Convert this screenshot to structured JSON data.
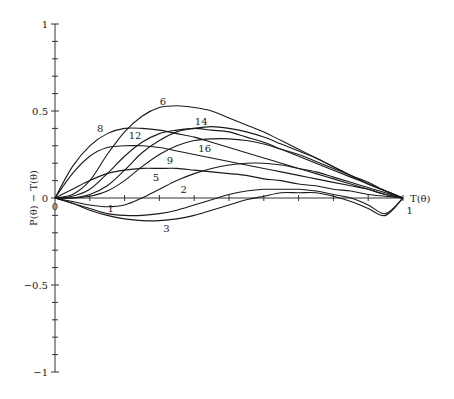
{
  "chart_data": {
    "type": "line",
    "title": "",
    "xlabel": "T(θ)",
    "ylabel": "P(θ) − T(θ)",
    "xlim": [
      0,
      1
    ],
    "ylim": [
      -1,
      1
    ],
    "grid": false,
    "legend": "none (curves labeled inline)",
    "x_tick_labels": [
      "0",
      "1"
    ],
    "y_tick_labels": [
      "1",
      "0.5",
      "0",
      "−0.5",
      "−1"
    ],
    "y_tick_values": [
      1,
      0.5,
      0,
      -0.5,
      -1
    ],
    "x": [
      0,
      0.05,
      0.1,
      0.15,
      0.2,
      0.25,
      0.3,
      0.35,
      0.4,
      0.45,
      0.5,
      0.55,
      0.6,
      0.65,
      0.7,
      0.75,
      0.8,
      0.85,
      0.9,
      0.95,
      1.0
    ],
    "series": [
      {
        "name": "6",
        "label_pos": [
          0.31,
          0.56
        ],
        "values": [
          0,
          0.02,
          0.1,
          0.25,
          0.38,
          0.47,
          0.52,
          0.53,
          0.52,
          0.5,
          0.46,
          0.42,
          0.38,
          0.33,
          0.28,
          0.23,
          0.18,
          0.13,
          0.08,
          0.04,
          0
        ]
      },
      {
        "name": "8",
        "label_pos": [
          0.13,
          0.4
        ],
        "values": [
          0,
          0.18,
          0.3,
          0.37,
          0.4,
          0.4,
          0.39,
          0.37,
          0.35,
          0.32,
          0.29,
          0.26,
          0.23,
          0.2,
          0.17,
          0.14,
          0.11,
          0.08,
          0.05,
          0.02,
          0
        ]
      },
      {
        "name": "12",
        "label_pos": [
          0.23,
          0.36
        ],
        "values": [
          0,
          0.01,
          0.05,
          0.14,
          0.24,
          0.32,
          0.37,
          0.39,
          0.4,
          0.39,
          0.38,
          0.35,
          0.32,
          0.28,
          0.24,
          0.2,
          0.16,
          0.12,
          0.08,
          0.04,
          0
        ]
      },
      {
        "name": "14",
        "label_pos": [
          0.42,
          0.44
        ],
        "values": [
          0,
          0.0,
          0.02,
          0.07,
          0.16,
          0.26,
          0.33,
          0.38,
          0.4,
          0.41,
          0.4,
          0.38,
          0.35,
          0.31,
          0.27,
          0.23,
          0.18,
          0.13,
          0.09,
          0.04,
          0
        ]
      },
      {
        "name": "16",
        "label_pos": [
          0.43,
          0.29
        ],
        "values": [
          0,
          0.0,
          0.01,
          0.04,
          0.1,
          0.18,
          0.25,
          0.3,
          0.33,
          0.34,
          0.34,
          0.33,
          0.31,
          0.28,
          0.25,
          0.21,
          0.17,
          0.13,
          0.08,
          0.04,
          0
        ]
      },
      {
        "name": "9",
        "label_pos": [
          0.33,
          0.22
        ],
        "values": [
          0,
          0.14,
          0.24,
          0.29,
          0.3,
          0.3,
          0.29,
          0.27,
          0.25,
          0.23,
          0.21,
          0.19,
          0.17,
          0.15,
          0.13,
          0.11,
          0.09,
          0.07,
          0.05,
          0.02,
          0
        ]
      },
      {
        "name": "5",
        "label_pos": [
          0.29,
          0.12
        ],
        "values": [
          0,
          0.05,
          0.1,
          0.14,
          0.16,
          0.17,
          0.17,
          0.17,
          0.16,
          0.15,
          0.14,
          0.13,
          0.11,
          0.1,
          0.08,
          0.07,
          0.05,
          0.04,
          0.02,
          0.01,
          0
        ]
      },
      {
        "name": "2",
        "label_pos": [
          0.37,
          0.05
        ],
        "values": [
          0,
          -0.02,
          -0.04,
          -0.05,
          -0.04,
          0.0,
          0.05,
          0.1,
          0.14,
          0.17,
          0.19,
          0.2,
          0.2,
          0.19,
          0.17,
          0.15,
          0.12,
          0.09,
          0.06,
          0.03,
          0
        ]
      },
      {
        "name": "1",
        "label_pos": [
          0.16,
          -0.06
        ],
        "values": [
          0,
          -0.03,
          -0.06,
          -0.09,
          -0.1,
          -0.1,
          -0.09,
          -0.07,
          -0.04,
          -0.01,
          0.02,
          0.04,
          0.05,
          0.05,
          0.05,
          0.04,
          0.02,
          0.0,
          -0.04,
          -0.09,
          0
        ]
      },
      {
        "name": "3",
        "label_pos": [
          0.32,
          -0.17
        ],
        "values": [
          0,
          -0.03,
          -0.07,
          -0.1,
          -0.12,
          -0.13,
          -0.13,
          -0.12,
          -0.1,
          -0.07,
          -0.04,
          -0.01,
          0.01,
          0.03,
          0.03,
          0.03,
          0.01,
          -0.02,
          -0.06,
          -0.1,
          0
        ]
      }
    ],
    "end_label": {
      "text": "1",
      "pos": [
        1.01,
        -0.07
      ]
    }
  }
}
